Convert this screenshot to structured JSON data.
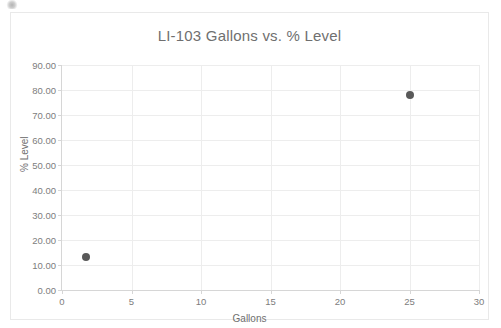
{
  "chart_data": {
    "type": "scatter",
    "title": "LI-103 Gallons vs. % Level",
    "xlabel": "Gallons",
    "ylabel": "% Level",
    "xlim": [
      0,
      30
    ],
    "ylim": [
      0,
      90
    ],
    "grid": true,
    "legend": null,
    "x_ticks": [
      "0",
      "5",
      "10",
      "15",
      "20",
      "25",
      "30"
    ],
    "x_tick_values": [
      0,
      5,
      10,
      15,
      20,
      25,
      30
    ],
    "y_ticks": [
      "0.00",
      "10.00",
      "20.00",
      "30.00",
      "40.00",
      "50.00",
      "60.00",
      "70.00",
      "80.00",
      "90.00"
    ],
    "y_tick_values": [
      0,
      10,
      20,
      30,
      40,
      50,
      60,
      70,
      80,
      90
    ],
    "series": [
      {
        "name": "LI-103",
        "marker_color": "#595959",
        "points": [
          {
            "x": 1.7,
            "y": 13.3
          },
          {
            "x": 25.0,
            "y": 78.0
          }
        ]
      }
    ]
  },
  "colors": {
    "marker": "#595959",
    "gridline": "#ededed",
    "axis_line": "#d6d6d6",
    "text": "#6f6f6f",
    "tick_text": "#7d7d7d",
    "frame_border": "#e9e9e9",
    "background": "#ffffff"
  }
}
